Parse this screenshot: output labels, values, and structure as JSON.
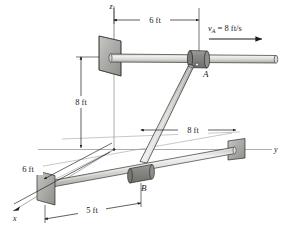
{
  "figure": {
    "background_color": "#ffffff",
    "line_color": "#1a1a1a",
    "rod_fill_light": "#e8e8e6",
    "rod_fill_mid": "#cfcfcc",
    "collar_fill": "#8f8f8c",
    "plate_fill": "#b8b8b4",
    "plate_fill_dark": "#9a9a96",
    "axis_color": "#7a7a7a"
  },
  "axes": {
    "z_label": "z",
    "y_label": "y",
    "x_label": "x"
  },
  "points": {
    "a_label": "A",
    "b_label": "B"
  },
  "velocity": {
    "symbol": "v",
    "subscript": "A",
    "equals": "=",
    "value": "8 ft/s",
    "full_text": "v_A = 8 ft/s",
    "direction": "right"
  },
  "dimensions": [
    {
      "id": "top-6ft",
      "label": "6 ft",
      "orientation": "horizontal",
      "note": "from z-axis to collar A along y"
    },
    {
      "id": "left-8ft",
      "label": "8 ft",
      "orientation": "vertical",
      "note": "height of upper rod above xy-plane"
    },
    {
      "id": "mid-8ft",
      "label": "8 ft",
      "orientation": "horizontal",
      "note": "along y to lower rod wall support"
    },
    {
      "id": "lower-6ft",
      "label": "6 ft",
      "orientation": "oblique",
      "note": "along x from origin to lower wall plate"
    },
    {
      "id": "bottom-5ft",
      "label": "5 ft",
      "orientation": "oblique",
      "note": "along lower rod from wall plate to collar B"
    }
  ],
  "labels": {
    "top_6ft": "6 ft",
    "left_8ft": "8 ft",
    "mid_8ft": "8 ft",
    "lower_6ft": "6 ft",
    "bottom_5ft": "5 ft"
  }
}
